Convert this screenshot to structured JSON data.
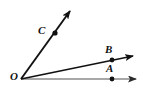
{
  "figure": {
    "name": "three-rays-from-common-vertex",
    "background_color": "#ffffff",
    "stroke_color": "#111111",
    "secondary_stroke_color": "#8a8a8a",
    "point_color": "#111111",
    "labels": {
      "vertex": "O",
      "point_a": "A",
      "point_b": "B",
      "point_c": "C"
    },
    "geometry": {
      "vertex": {
        "x": 21,
        "y": 79
      },
      "rays": [
        {
          "id": "ray-OA",
          "through_label": "A",
          "point": {
            "x": 112,
            "y": 79
          },
          "arrow_tip": {
            "x": 143,
            "y": 79
          },
          "direction": "horizontal-right"
        },
        {
          "id": "ray-OB",
          "through_label": "B",
          "point": {
            "x": 112,
            "y": 60
          },
          "arrow_tip": {
            "x": 141,
            "y": 54
          },
          "direction": "up-right-shallow"
        },
        {
          "id": "ray-OC",
          "through_label": "C",
          "point": {
            "x": 55,
            "y": 33
          },
          "arrow_tip": {
            "x": 74,
            "y": 6
          },
          "direction": "up-right-steep"
        }
      ]
    }
  }
}
